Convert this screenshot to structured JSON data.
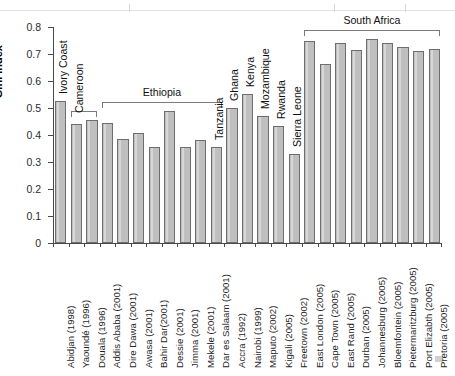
{
  "figure": {
    "y_axis_title": "Gini index",
    "y_ticks": [
      "0",
      "0.1",
      "0.2",
      "0.3",
      "0.4",
      "0.5",
      "0.6",
      "0.7",
      "0.8"
    ],
    "bar_fill": "#bfbfbf",
    "bar_stroke": "#6e6e6e",
    "axis_color": "#4a4a4a"
  },
  "chart_data": {
    "type": "bar",
    "title": "",
    "xlabel": "",
    "ylabel": "Gini index",
    "ylim": [
      0,
      0.8
    ],
    "ytick_step": 0.1,
    "grid": false,
    "legend": "none",
    "categories": [
      "Abidjan (1998)",
      "Yaoundé (1996)",
      "Douala (1996)",
      "Addis Ababa (2001)",
      "Dire Dawa (2001)",
      "Awasa (2001)",
      "Bahir Dar(2001)",
      "Dessie (2001)",
      "Jimma (2001)",
      "Mekele (2001)",
      "Dar es Salaam (2001)",
      "Accra (1992)",
      "Nairobi (1999)",
      "Maputo (2002)",
      "Kigali (2005)",
      "Freetown (2002)",
      "East London (2005)",
      "Cape Town (2005)",
      "East Rand (2005)",
      "Durban (2005)",
      "Johannesburg (2005)",
      "Bloemfontein (2005)",
      "Pietermaritzburg (2005)",
      "Port Elizabth (2005)",
      "Pretoria (2005)"
    ],
    "values": [
      0.527,
      0.44,
      0.455,
      0.446,
      0.386,
      0.408,
      0.355,
      0.488,
      0.354,
      0.383,
      0.357,
      0.5,
      0.551,
      0.47,
      0.435,
      0.328,
      0.748,
      0.662,
      0.74,
      0.715,
      0.756,
      0.741,
      0.725,
      0.712,
      0.717
    ],
    "country_groups": [
      {
        "name": "Ivory Coast",
        "orientation": "vertical",
        "first": 0,
        "last": 0,
        "bracket": false
      },
      {
        "name": "Cameroon",
        "orientation": "vertical",
        "first": 1,
        "last": 2,
        "bracket": true
      },
      {
        "name": "Ethiopia",
        "orientation": "horizontal",
        "first": 3,
        "last": 10,
        "bracket": true
      },
      {
        "name": "Tanzania",
        "orientation": "vertical",
        "first": 10,
        "last": 10,
        "bracket": false
      },
      {
        "name": "Ghana",
        "orientation": "vertical",
        "first": 11,
        "last": 11,
        "bracket": false
      },
      {
        "name": "Kenya",
        "orientation": "vertical",
        "first": 12,
        "last": 12,
        "bracket": false
      },
      {
        "name": "Mozambique",
        "orientation": "vertical",
        "first": 13,
        "last": 13,
        "bracket": false
      },
      {
        "name": "Rwanda",
        "orientation": "vertical",
        "first": 14,
        "last": 14,
        "bracket": false
      },
      {
        "name": "Sierra Leone",
        "orientation": "vertical",
        "first": 15,
        "last": 15,
        "bracket": false
      },
      {
        "name": "South Africa",
        "orientation": "horizontal",
        "first": 16,
        "last": 24,
        "bracket": true
      }
    ]
  }
}
